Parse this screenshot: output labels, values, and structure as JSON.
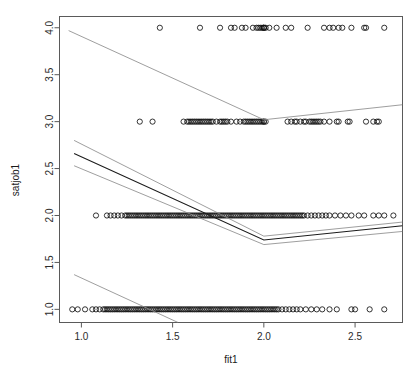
{
  "chart_data": {
    "type": "scatter",
    "title": "",
    "subtitle": "",
    "xlabel": "fit1",
    "ylabel": "satjob1",
    "xlim": [
      0.88,
      2.76
    ],
    "ylim": [
      0.86,
      4.12
    ],
    "xticks": [
      1.0,
      1.5,
      2.0,
      2.5
    ],
    "xtick_labels": [
      "1.0",
      "1.5",
      "2.0",
      "2.5"
    ],
    "yticks": [
      1.0,
      1.5,
      2.0,
      2.5,
      3.0,
      3.5,
      4.0
    ],
    "ytick_labels": [
      "1.0",
      "1.5",
      "2.0",
      "2.5",
      "3.0",
      "3.5",
      "4.0"
    ],
    "grid": false,
    "legend": false,
    "legend_position": "none",
    "point_marker": "open-circle",
    "point_color": "#111111",
    "series": [
      {
        "name": "satjob1 = 4",
        "y": 4.0,
        "x": [
          1.43,
          1.65,
          1.76,
          1.82,
          1.84,
          1.88,
          1.9,
          1.94,
          1.96,
          1.97,
          1.98,
          1.99,
          2.0,
          2.0,
          2.0,
          2.01,
          2.03,
          2.07,
          2.12,
          2.15,
          2.24,
          2.33,
          2.36,
          2.38,
          2.41,
          2.43,
          2.48,
          2.55,
          2.56,
          2.66
        ]
      },
      {
        "name": "satjob1 = 3",
        "y": 3.0,
        "x": [
          1.32,
          1.39,
          1.56,
          1.58,
          1.59,
          1.6,
          1.61,
          1.62,
          1.63,
          1.64,
          1.65,
          1.66,
          1.67,
          1.68,
          1.69,
          1.7,
          1.71,
          1.72,
          1.74,
          1.76,
          1.77,
          1.78,
          1.79,
          1.8,
          1.82,
          1.85,
          1.87,
          1.89,
          1.9,
          1.91,
          1.92,
          1.93,
          1.94,
          1.95,
          1.96,
          1.97,
          1.98,
          1.99,
          2.0,
          2.0,
          2.01,
          2.13,
          2.15,
          2.17,
          2.18,
          2.2,
          2.22,
          2.23,
          2.25,
          2.26,
          2.27,
          2.28,
          2.29,
          2.3,
          2.31,
          2.33,
          2.36,
          2.4,
          2.41,
          2.46,
          2.47,
          2.56,
          2.6,
          2.62,
          2.63
        ]
      },
      {
        "name": "satjob1 = 2",
        "y": 2.0,
        "x": [
          1.08,
          1.14,
          1.16,
          1.18,
          1.2,
          1.22,
          1.24,
          1.25,
          1.26,
          1.27,
          1.28,
          1.29,
          1.3,
          1.31,
          1.32,
          1.33,
          1.34,
          1.35,
          1.36,
          1.37,
          1.38,
          1.39,
          1.4,
          1.41,
          1.42,
          1.43,
          1.44,
          1.45,
          1.46,
          1.47,
          1.48,
          1.49,
          1.5,
          1.51,
          1.52,
          1.53,
          1.54,
          1.55,
          1.56,
          1.57,
          1.58,
          1.59,
          1.6,
          1.61,
          1.62,
          1.63,
          1.64,
          1.65,
          1.66,
          1.67,
          1.68,
          1.69,
          1.7,
          1.71,
          1.72,
          1.73,
          1.74,
          1.75,
          1.76,
          1.77,
          1.78,
          1.79,
          1.8,
          1.81,
          1.82,
          1.83,
          1.84,
          1.85,
          1.86,
          1.87,
          1.88,
          1.89,
          1.9,
          1.91,
          1.92,
          1.93,
          1.94,
          1.95,
          1.96,
          1.97,
          1.98,
          1.99,
          2.0,
          2.01,
          2.02,
          2.03,
          2.04,
          2.05,
          2.06,
          2.07,
          2.08,
          2.09,
          2.1,
          2.11,
          2.12,
          2.13,
          2.14,
          2.15,
          2.16,
          2.17,
          2.18,
          2.19,
          2.2,
          2.21,
          2.22,
          2.24,
          2.26,
          2.28,
          2.3,
          2.32,
          2.34,
          2.36,
          2.39,
          2.42,
          2.45,
          2.48,
          2.52,
          2.55,
          2.6,
          2.63,
          2.66,
          2.71
        ]
      },
      {
        "name": "satjob1 = 1",
        "y": 1.0,
        "x": [
          0.95,
          0.98,
          1.02,
          1.06,
          1.08,
          1.1,
          1.12,
          1.13,
          1.14,
          1.15,
          1.16,
          1.17,
          1.18,
          1.19,
          1.2,
          1.21,
          1.22,
          1.23,
          1.24,
          1.25,
          1.26,
          1.27,
          1.28,
          1.29,
          1.3,
          1.31,
          1.32,
          1.33,
          1.34,
          1.35,
          1.36,
          1.37,
          1.38,
          1.39,
          1.4,
          1.41,
          1.42,
          1.43,
          1.44,
          1.45,
          1.46,
          1.47,
          1.48,
          1.49,
          1.5,
          1.51,
          1.52,
          1.53,
          1.54,
          1.55,
          1.56,
          1.57,
          1.58,
          1.59,
          1.6,
          1.61,
          1.62,
          1.63,
          1.64,
          1.65,
          1.66,
          1.67,
          1.68,
          1.69,
          1.7,
          1.71,
          1.72,
          1.73,
          1.74,
          1.75,
          1.76,
          1.77,
          1.78,
          1.79,
          1.8,
          1.81,
          1.82,
          1.83,
          1.84,
          1.85,
          1.86,
          1.87,
          1.88,
          1.89,
          1.9,
          1.91,
          1.92,
          1.93,
          1.94,
          1.95,
          1.96,
          1.97,
          1.98,
          1.99,
          2.0,
          2.01,
          2.02,
          2.03,
          2.04,
          2.05,
          2.06,
          2.07,
          2.08,
          2.1,
          2.12,
          2.14,
          2.16,
          2.18,
          2.2,
          2.23,
          2.26,
          2.29,
          2.32,
          2.36,
          2.4,
          2.48,
          2.5,
          2.58,
          2.66
        ]
      }
    ],
    "lines": [
      {
        "name": "upper-curve",
        "style": "thin-grey",
        "points": [
          [
            0.93,
            3.97
          ],
          [
            2.0,
            3.02
          ],
          [
            2.76,
            3.18
          ]
        ]
      },
      {
        "name": "fit-upper-band",
        "style": "thin-grey",
        "points": [
          [
            0.96,
            2.8
          ],
          [
            2.0,
            1.78
          ],
          [
            2.76,
            1.93
          ]
        ]
      },
      {
        "name": "fit-main",
        "style": "dark",
        "points": [
          [
            0.96,
            2.66
          ],
          [
            2.0,
            1.74
          ],
          [
            2.76,
            1.89
          ]
        ]
      },
      {
        "name": "fit-lower-band",
        "style": "thin-grey",
        "points": [
          [
            0.96,
            2.53
          ],
          [
            2.0,
            1.69
          ],
          [
            2.76,
            1.83
          ]
        ]
      },
      {
        "name": "lower-curve",
        "style": "thin-grey",
        "points": [
          [
            0.96,
            1.37
          ],
          [
            1.53,
            0.86
          ]
        ]
      }
    ]
  },
  "axes": {
    "x_title": "fit1",
    "y_title": "satjob1"
  },
  "footer": {
    "caption": ""
  }
}
